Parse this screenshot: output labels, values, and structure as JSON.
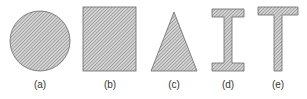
{
  "figure": {
    "type": "cross-section shapes",
    "colors": {
      "outline": "#6a6a6a",
      "hatch_line": "#7a7a7a",
      "hatch_bg": "#d6d6d6",
      "label": "#333333"
    },
    "shapes": [
      {
        "id": "a",
        "shape": "circle",
        "label": "(a)"
      },
      {
        "id": "b",
        "shape": "rectangle",
        "label": "(b)"
      },
      {
        "id": "c",
        "shape": "triangle",
        "label": "(c)"
      },
      {
        "id": "d",
        "shape": "i-beam",
        "label": "(d)"
      },
      {
        "id": "e",
        "shape": "t-beam",
        "label": "(e)"
      }
    ]
  }
}
